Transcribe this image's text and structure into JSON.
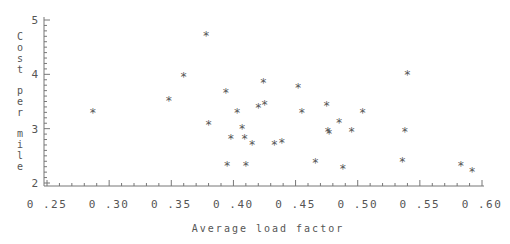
{
  "chart_data": {
    "type": "scatter",
    "title": "",
    "xlabel": "Average load factor",
    "ylabel": "Cost per mile",
    "xlim": [
      0.25,
      0.6
    ],
    "ylim": [
      2,
      5
    ],
    "xticks": [
      "0.25",
      "0.30",
      "0.35",
      "0.40",
      "0.45",
      "0.50",
      "0.55",
      "0.60"
    ],
    "yticks": [
      "2",
      "3",
      "4",
      "5"
    ],
    "grid": false,
    "marker": "*",
    "points": [
      [
        0.287,
        3.3
      ],
      [
        0.348,
        3.53
      ],
      [
        0.36,
        3.97
      ],
      [
        0.378,
        4.72
      ],
      [
        0.38,
        3.09
      ],
      [
        0.394,
        3.68
      ],
      [
        0.395,
        2.34
      ],
      [
        0.398,
        2.82
      ],
      [
        0.403,
        3.3
      ],
      [
        0.407,
        3.01
      ],
      [
        0.409,
        2.83
      ],
      [
        0.41,
        2.33
      ],
      [
        0.415,
        2.72
      ],
      [
        0.42,
        3.4
      ],
      [
        0.424,
        3.85
      ],
      [
        0.425,
        3.45
      ],
      [
        0.433,
        2.71
      ],
      [
        0.439,
        2.75
      ],
      [
        0.452,
        3.76
      ],
      [
        0.455,
        3.3
      ],
      [
        0.466,
        2.38
      ],
      [
        0.475,
        3.43
      ],
      [
        0.476,
        2.96
      ],
      [
        0.477,
        2.92
      ],
      [
        0.485,
        3.13
      ],
      [
        0.488,
        2.27
      ],
      [
        0.495,
        2.95
      ],
      [
        0.504,
        3.3
      ],
      [
        0.536,
        2.4
      ],
      [
        0.538,
        2.96
      ],
      [
        0.54,
        4.01
      ],
      [
        0.583,
        2.34
      ],
      [
        0.592,
        2.22
      ]
    ]
  }
}
